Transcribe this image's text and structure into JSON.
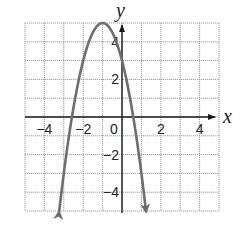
{
  "chart_data": {
    "type": "line",
    "title": "",
    "xlabel": "x",
    "ylabel": "y",
    "xlim": [
      -5,
      5
    ],
    "ylim": [
      -5,
      5
    ],
    "grid": true,
    "x_ticks": [
      -4,
      -2,
      0,
      2,
      4
    ],
    "y_ticks": [
      -4,
      -2,
      2,
      4
    ],
    "x_tick_labels": [
      "−4",
      "−2",
      "0",
      "2",
      "4"
    ],
    "y_tick_labels": [
      "−4",
      "−2",
      "2",
      "4"
    ],
    "series": [
      {
        "name": "parabola",
        "equation": "y = -2(x + 1)^2 + 5",
        "vertex": [
          -1,
          5
        ],
        "y_intercept": 3,
        "x_intercepts": [
          -2.58,
          0.58
        ],
        "x": [
          -3.24,
          -3,
          -2.5,
          -2,
          -1.5,
          -1,
          -0.5,
          0,
          0.5,
          1,
          1.24
        ],
        "y": [
          -5,
          -3,
          -0.5,
          3,
          4.5,
          5,
          4.5,
          3,
          0.5,
          -3,
          -5
        ],
        "arrows_at_ends": true,
        "color": "#6e6e6e"
      }
    ],
    "legend": null
  },
  "colors": {
    "curve": "#6e6e6e",
    "axis": "#1a1a1a",
    "grid": "#9a9a9a"
  }
}
